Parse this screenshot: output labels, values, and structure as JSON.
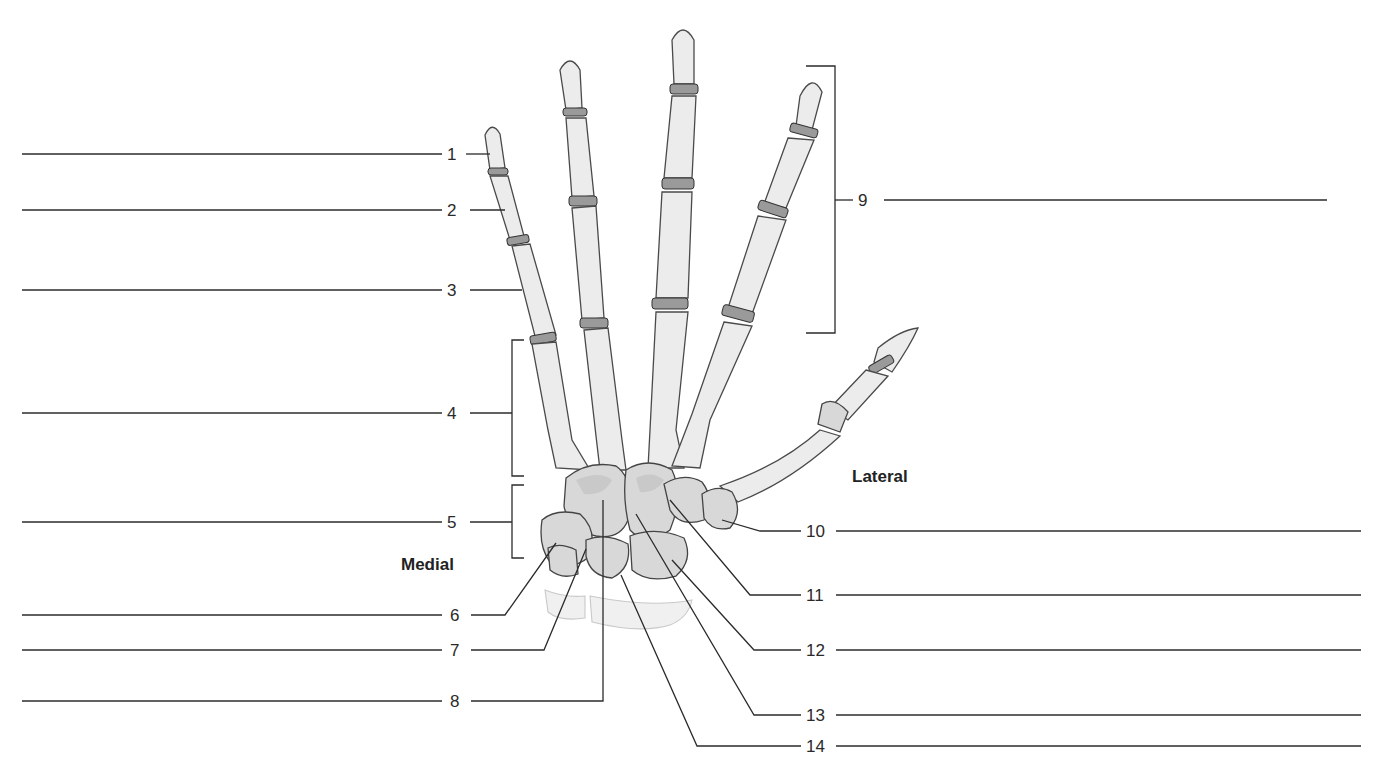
{
  "figure": {
    "orientation_labels": {
      "medial": "Medial",
      "lateral": "Lateral"
    },
    "callouts": [
      {
        "number": "1",
        "side": "left",
        "target": "distal phalanx (little finger)",
        "answer": ""
      },
      {
        "number": "2",
        "side": "left",
        "target": "middle phalanx (little finger)",
        "answer": ""
      },
      {
        "number": "3",
        "side": "left",
        "target": "proximal phalanx (little finger)",
        "answer": ""
      },
      {
        "number": "4",
        "side": "left",
        "target": "metacarpals (bracket)",
        "answer": ""
      },
      {
        "number": "5",
        "side": "left",
        "target": "carpals (bracket)",
        "answer": ""
      },
      {
        "number": "6",
        "side": "left",
        "target": "carpal bone",
        "answer": ""
      },
      {
        "number": "7",
        "side": "left",
        "target": "carpal bone",
        "answer": ""
      },
      {
        "number": "8",
        "side": "left",
        "target": "carpal bone",
        "answer": ""
      },
      {
        "number": "9",
        "side": "right",
        "target": "phalanges (bracket)",
        "answer": ""
      },
      {
        "number": "10",
        "side": "right",
        "target": "carpal bone",
        "answer": ""
      },
      {
        "number": "11",
        "side": "right",
        "target": "carpal bone",
        "answer": ""
      },
      {
        "number": "12",
        "side": "right",
        "target": "carpal bone",
        "answer": ""
      },
      {
        "number": "13",
        "side": "right",
        "target": "carpal bone",
        "answer": ""
      },
      {
        "number": "14",
        "side": "right",
        "target": "carpal bone",
        "answer": ""
      }
    ]
  }
}
